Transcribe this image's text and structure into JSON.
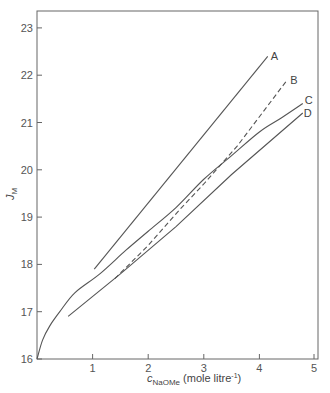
{
  "chart_data": {
    "type": "line",
    "title": "",
    "xlabel": "c_NaOMe (mole litre^-1)",
    "xlabel_main": "c",
    "xlabel_sub": "NaOMe",
    "xlabel_units": "(mole litre",
    "xlabel_units_sup": "-1",
    "xlabel_units_close": ")",
    "ylabel": "J_M",
    "ylabel_main": "J",
    "ylabel_sub": "M",
    "xlim": [
      0,
      5
    ],
    "ylim": [
      16,
      23.5
    ],
    "xticks": [
      1,
      2,
      3,
      4,
      5
    ],
    "yticks": [
      16,
      17,
      18,
      19,
      20,
      21,
      22,
      23
    ],
    "grid": false,
    "legend": "inline labels at line ends",
    "series": [
      {
        "name": "A",
        "style": "solid",
        "x": [
          1.03,
          4.15
        ],
        "y": [
          17.9,
          22.4
        ]
      },
      {
        "name": "B",
        "style": "dashed",
        "x": [
          1.4,
          2.0,
          2.6,
          3.0,
          3.6,
          4.5
        ],
        "y": [
          17.7,
          18.4,
          19.2,
          19.7,
          20.5,
          21.9
        ]
      },
      {
        "name": "C",
        "style": "solid",
        "x": [
          0.0,
          0.1,
          0.23,
          0.41,
          0.68,
          1.13,
          1.6,
          2.0,
          2.5,
          3.0,
          3.5,
          4.0,
          4.4,
          4.78
        ],
        "y": [
          16.0,
          16.4,
          16.7,
          17.0,
          17.4,
          17.8,
          18.3,
          18.7,
          19.2,
          19.8,
          20.3,
          20.8,
          21.1,
          21.4
        ]
      },
      {
        "name": "D",
        "style": "solid",
        "x": [
          0.56,
          1.5,
          2.5,
          3.5,
          4.78
        ],
        "y": [
          16.9,
          17.8,
          18.8,
          19.9,
          21.2
        ]
      }
    ]
  }
}
